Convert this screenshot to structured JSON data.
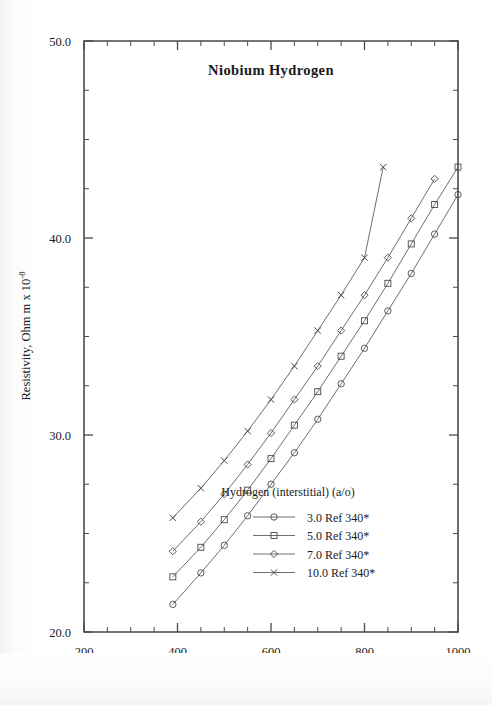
{
  "chart_data": {
    "type": "line",
    "title": "Niobium  Hydrogen",
    "xlabel": "Temperature,  K",
    "ylabel": "Resistivity, Ohm m x 10",
    "ylabel_exponent": "-8",
    "xlim": [
      200,
      1000
    ],
    "ylim": [
      20.0,
      50.0
    ],
    "xticks_major": [
      200,
      400,
      600,
      800,
      1000
    ],
    "xticks_major_labels": [
      "200",
      "400",
      "600",
      "800",
      "1000"
    ],
    "xtick_minor_step": 50,
    "yticks_major": [
      20.0,
      30.0,
      40.0,
      50.0
    ],
    "yticks_major_labels": [
      "20.0",
      "30.0",
      "40.0",
      "50.0"
    ],
    "ytick_minor_step": 2.5,
    "grid": false,
    "legend_position": "inside-lower-right",
    "legend_title": "Hydrogen (interstitial) (a/o)",
    "series": [
      {
        "name": "3.0 Ref 340*",
        "marker": "circle",
        "x": [
          390,
          450,
          500,
          550,
          600,
          650,
          700,
          750,
          800,
          850,
          900,
          950,
          1000
        ],
        "y": [
          21.4,
          23.0,
          24.4,
          25.9,
          27.5,
          29.1,
          30.8,
          32.6,
          34.4,
          36.3,
          38.2,
          40.2,
          42.2
        ]
      },
      {
        "name": "5.0 Ref 340*",
        "marker": "square",
        "x": [
          390,
          450,
          500,
          550,
          600,
          650,
          700,
          750,
          800,
          850,
          900,
          950,
          1000
        ],
        "y": [
          22.8,
          24.3,
          25.7,
          27.2,
          28.8,
          30.5,
          32.2,
          34.0,
          35.8,
          37.7,
          39.7,
          41.7,
          43.6
        ]
      },
      {
        "name": "7.0 Ref 340*",
        "marker": "diamond",
        "x": [
          390,
          450,
          500,
          550,
          600,
          650,
          700,
          750,
          800,
          850,
          900,
          950
        ],
        "y": [
          24.1,
          25.6,
          27.0,
          28.5,
          30.1,
          31.8,
          33.5,
          35.3,
          37.1,
          39.0,
          41.0,
          43.0
        ]
      },
      {
        "name": "10.0 Ref 340*",
        "marker": "cross",
        "x": [
          390,
          450,
          500,
          550,
          600,
          650,
          700,
          750,
          800,
          840
        ],
        "y": [
          25.8,
          27.3,
          28.7,
          30.2,
          31.8,
          33.5,
          35.3,
          37.1,
          39.0,
          43.6
        ]
      }
    ]
  }
}
